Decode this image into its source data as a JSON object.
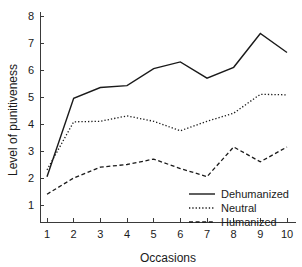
{
  "chart_data": {
    "type": "line",
    "title": "",
    "xlabel": "Occasions",
    "ylabel": "Level of punitiveness",
    "x": [
      1,
      2,
      3,
      4,
      5,
      6,
      7,
      8,
      9,
      10
    ],
    "xtick_labels": [
      "1",
      "2",
      "3",
      "4",
      "5",
      "6",
      "7",
      "8",
      "9",
      "10"
    ],
    "ytick_labels": [
      "1",
      "2",
      "3",
      "4",
      "5",
      "6",
      "7",
      "8"
    ],
    "ytick_values": [
      1,
      2,
      3,
      4,
      5,
      6,
      7,
      8
    ],
    "xlim": [
      0.6,
      10.4
    ],
    "ylim": [
      0.45,
      8.2
    ],
    "grid": false,
    "legend_position": "bottom-right",
    "series": [
      {
        "name": "Dehumanized",
        "style": "solid",
        "color": "#1a1a1a",
        "values": [
          2.05,
          4.95,
          5.35,
          5.42,
          6.05,
          6.3,
          5.7,
          6.1,
          7.35,
          6.65
        ]
      },
      {
        "name": "Neutral",
        "style": "dotted",
        "color": "#1a1a1a",
        "values": [
          2.3,
          4.08,
          4.1,
          4.3,
          4.1,
          3.75,
          4.1,
          4.4,
          5.1,
          5.08
        ]
      },
      {
        "name": "Humanized",
        "style": "dashed",
        "color": "#1a1a1a",
        "values": [
          1.4,
          2.0,
          2.4,
          2.5,
          2.7,
          2.35,
          2.05,
          3.15,
          2.6,
          3.15
        ]
      }
    ]
  },
  "legend": {
    "entries": [
      {
        "label": "Dehumanized",
        "style": "solid"
      },
      {
        "label": "Neutral",
        "style": "dotted"
      },
      {
        "label": "Humanized",
        "style": "dashed"
      }
    ]
  }
}
